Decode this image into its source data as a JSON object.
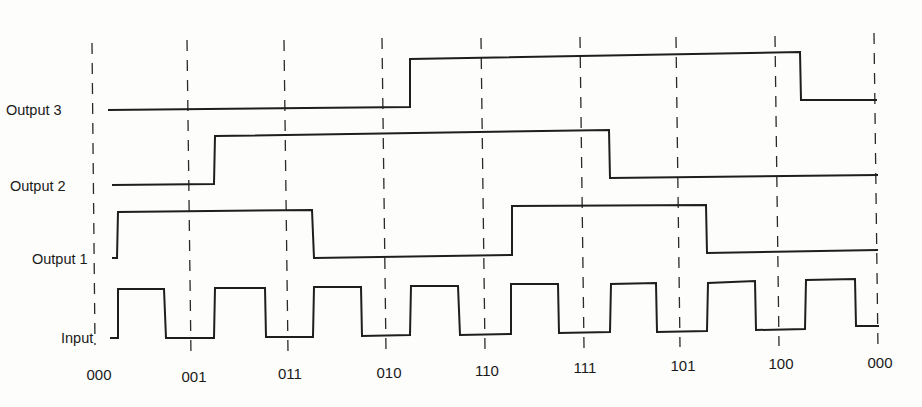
{
  "diagram": {
    "type": "timing-diagram",
    "signals": [
      {
        "name": "Output 3",
        "label": "Output 3"
      },
      {
        "name": "Output 2",
        "label": "Output 2"
      },
      {
        "name": "Output 1",
        "label": "Output 1"
      },
      {
        "name": "Input",
        "label": "Input"
      }
    ],
    "states": [
      "000",
      "001",
      "011",
      "010",
      "110",
      "111",
      "101",
      "100",
      "000"
    ],
    "waveforms": {
      "input": "square wave clock, 8 pulses, rising shortly after each state boundary",
      "output1": [
        0,
        1,
        1,
        0,
        0,
        1,
        1,
        0,
        0
      ],
      "output2": [
        0,
        0,
        1,
        1,
        1,
        1,
        0,
        0,
        0
      ],
      "output3": [
        0,
        0,
        0,
        0,
        1,
        1,
        1,
        1,
        0
      ]
    },
    "colors": {
      "line": "#1e1e1e",
      "background": "#fdfdfb"
    }
  }
}
